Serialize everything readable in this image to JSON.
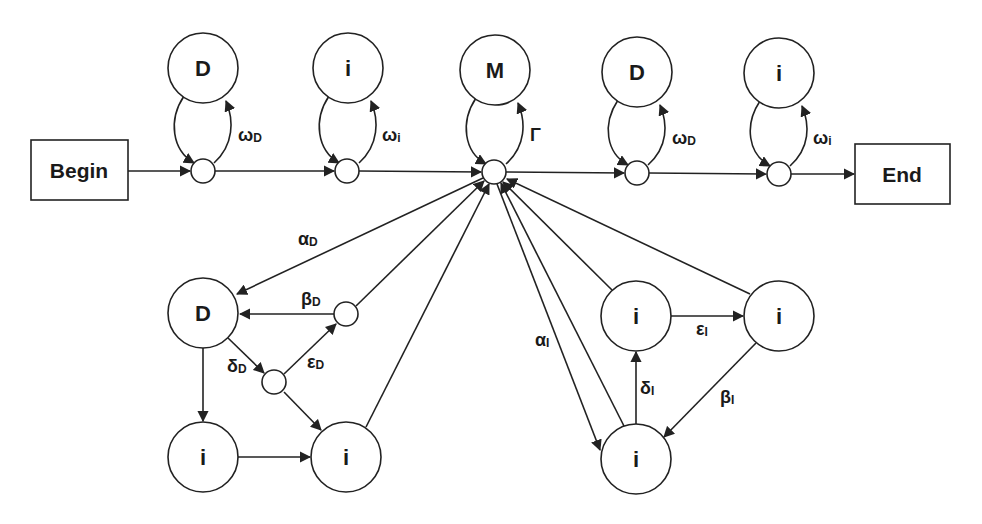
{
  "diagram": {
    "type": "state-transition-diagram",
    "colors": {
      "stroke": "#222222",
      "background": "#ffffff",
      "text": "#1a1a1a"
    },
    "terminals": {
      "begin": {
        "label": "Begin"
      },
      "end": {
        "label": "End"
      }
    },
    "top_states": [
      {
        "id": "D1",
        "label": "D",
        "self_loop_label": "ω",
        "self_loop_sub": "D"
      },
      {
        "id": "i1",
        "label": "i",
        "self_loop_label": "ω",
        "self_loop_sub": "i"
      },
      {
        "id": "M",
        "label": "M",
        "self_loop_label": "Γ",
        "self_loop_sub": ""
      },
      {
        "id": "D2",
        "label": "D",
        "self_loop_label": "ω",
        "self_loop_sub": "D"
      },
      {
        "id": "i2",
        "label": "i",
        "self_loop_label": "ω",
        "self_loop_sub": "i"
      }
    ],
    "deletion_module": {
      "states": [
        {
          "id": "DD",
          "label": "D"
        },
        {
          "id": "Di1",
          "label": "i"
        },
        {
          "id": "Di2",
          "label": "i"
        }
      ],
      "edge_labels": {
        "alpha": {
          "sym": "α",
          "sub": "D"
        },
        "beta": {
          "sym": "β",
          "sub": "D"
        },
        "delta": {
          "sym": "δ",
          "sub": "D"
        },
        "epsilon": {
          "sym": "ε",
          "sub": "D"
        }
      }
    },
    "insertion_module": {
      "states": [
        {
          "id": "Ia",
          "label": "i"
        },
        {
          "id": "Ib",
          "label": "i"
        },
        {
          "id": "Ic",
          "label": "i"
        }
      ],
      "edge_labels": {
        "alpha": {
          "sym": "α",
          "sub": "I"
        },
        "beta": {
          "sym": "β",
          "sub": "I"
        },
        "delta": {
          "sym": "δ",
          "sub": "I"
        },
        "epsilon": {
          "sym": "ε",
          "sub": "I"
        }
      }
    }
  }
}
